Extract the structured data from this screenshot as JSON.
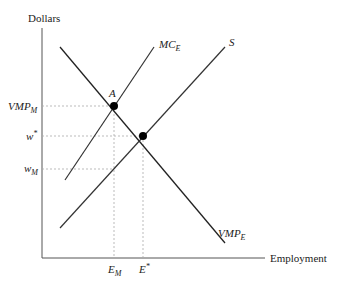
{
  "diagram": {
    "type": "monopsony-labor-market",
    "axes": {
      "y_label": "Dollars",
      "x_label": "Employment"
    },
    "curves": [
      {
        "id": "vmp",
        "label_main": "VMP",
        "label_sub": "E",
        "slope": "downward"
      },
      {
        "id": "mc",
        "label_main": "MC",
        "label_sub": "E",
        "slope": "upward-steep"
      },
      {
        "id": "supply",
        "label_main": "S",
        "label_sub": "",
        "slope": "upward"
      }
    ],
    "points": [
      {
        "id": "A",
        "label": "A",
        "desc": "MC_E intersects VMP_E"
      },
      {
        "id": "competitive",
        "label": "",
        "desc": "S intersects VMP_E"
      }
    ],
    "y_ticks": [
      {
        "main": "VMP",
        "sub": "M"
      },
      {
        "main": "w",
        "sup": "*"
      },
      {
        "main": "w",
        "sub": "M"
      }
    ],
    "x_ticks": [
      {
        "main": "E",
        "sub": "M"
      },
      {
        "main": "E",
        "sup": "*"
      }
    ]
  }
}
